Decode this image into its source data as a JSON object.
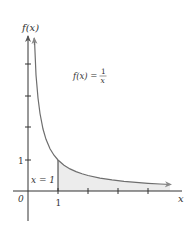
{
  "figure": {
    "function_label": "f(x) = 1/x",
    "function_label_parts": {
      "lhs": "f(x) =",
      "numerator": "1",
      "denominator": "x"
    },
    "y_axis_label": "f(x)",
    "x_axis_label": "x",
    "origin_label": "0",
    "x_tick_label": "1",
    "y_tick_label": "1",
    "boundary_label": "x = 1",
    "colors": {
      "axis": "#333333",
      "curve": "#6e6e6e",
      "shade": "#ececec",
      "text": "#333333"
    },
    "x_ticks": [
      1,
      2,
      3,
      4
    ],
    "y_ticks": [
      1,
      2,
      3,
      4
    ],
    "shaded_region": {
      "from_x": 1,
      "to": "infinity",
      "description": "area under f(x)=1/x to the right of x=1"
    }
  }
}
